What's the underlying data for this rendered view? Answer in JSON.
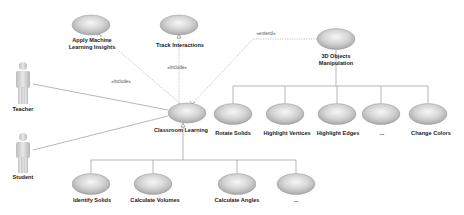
{
  "diagram": {
    "type": "uml-use-case",
    "colors": {
      "ellipse_center": "#f6f6f6",
      "ellipse_edge": "#a9a9a9",
      "ellipse_outline": "#8c8c8c",
      "line": "#9a9a9a",
      "text": "#222222"
    },
    "actors": [
      {
        "id": "teacher",
        "label": "Teacher",
        "x": 23,
        "y": 62
      },
      {
        "id": "student",
        "label": "Student",
        "x": 23,
        "y": 133
      }
    ],
    "use_cases": {
      "central": {
        "id": "classroom-learning",
        "label": "Classroom Learning",
        "cx": 187,
        "cy": 113
      },
      "included": [
        {
          "id": "apply-ml",
          "label_line1": "Apply Machine",
          "label_line2": "Learning Insights",
          "cx": 91,
          "cy": 25
        },
        {
          "id": "track-interactions",
          "label": "Track Interactions",
          "cx": 179,
          "cy": 25
        }
      ],
      "extension": {
        "id": "3d-objects",
        "label_line1": "3D Objects",
        "label_line2": "Manipulation",
        "cx": 336,
        "cy": 39
      },
      "manipulation_children": [
        {
          "id": "rotate-solids",
          "label": "Rotate Solids",
          "cx": 233
        },
        {
          "id": "highlight-vertices",
          "label": "Highlight Vertices",
          "cx": 285
        },
        {
          "id": "highlight-edges",
          "label": "Highlight Edges",
          "cx": 337
        },
        {
          "id": "more-manipulation",
          "label": "...",
          "cx": 381
        },
        {
          "id": "change-colors",
          "label": "Change Colors",
          "cx": 428
        }
      ],
      "learning_children": [
        {
          "id": "identify-solids",
          "label": "Identify Solids",
          "cx": 91
        },
        {
          "id": "calculate-volumes",
          "label": "Calculate Volumes",
          "cx": 153
        },
        {
          "id": "calculate-angles",
          "label": "Calculate Angles",
          "cx": 237
        },
        {
          "id": "more-learning",
          "label": "...",
          "cx": 296
        }
      ]
    },
    "relationships": {
      "include_label": "«include»",
      "include_label_2": "«include»",
      "extend_label": "«extend»"
    }
  }
}
